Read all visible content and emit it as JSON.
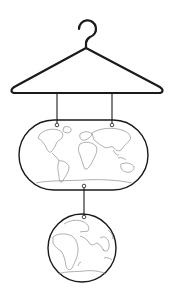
{
  "illustration": {
    "subject": "coat hanger holding world map and globe",
    "colors": {
      "background": "#ffffff",
      "outline": "#1a1a1a",
      "land": "#7a7a7a",
      "string": "#333333"
    },
    "hanger": {
      "hook_center": [
        87,
        29
      ],
      "hook_radius": 9,
      "neck": [
        85,
        48
      ],
      "left_tip": [
        11,
        92
      ],
      "right_tip": [
        163,
        92
      ],
      "bar_y": 93
    },
    "strings": [
      {
        "x": 57,
        "y1": 93,
        "y2": 124
      },
      {
        "x": 112,
        "y1": 93,
        "y2": 124
      },
      {
        "x": 84,
        "y1": 186,
        "y2": 217
      }
    ],
    "world_map_oval": {
      "x": 19,
      "y": 120,
      "width": 129,
      "height": 70,
      "rx": 35
    },
    "globe": {
      "cx": 82,
      "cy": 248,
      "r": 34
    }
  }
}
